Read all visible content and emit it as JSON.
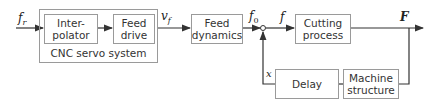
{
  "diagram": {
    "blocks": {
      "interpolator": "Inter-\npolator",
      "feed_drive": "Feed\ndrive",
      "feed_dynamics": "Feed\ndynamics",
      "cutting_process": "Cutting\nprocess",
      "delay": "Delay",
      "machine_structure": "Machine\nstructure"
    },
    "group_label": "CNC servo system",
    "signals": {
      "input": "f",
      "input_sub": "r",
      "drive_out": "v",
      "drive_out_sub": "f",
      "dyn_out": "f",
      "dyn_out_sub": "0",
      "feed": "f",
      "force": "F",
      "displacement": "x"
    },
    "colors": {
      "line": "#333333",
      "box_border": "#9a9a9a"
    }
  }
}
